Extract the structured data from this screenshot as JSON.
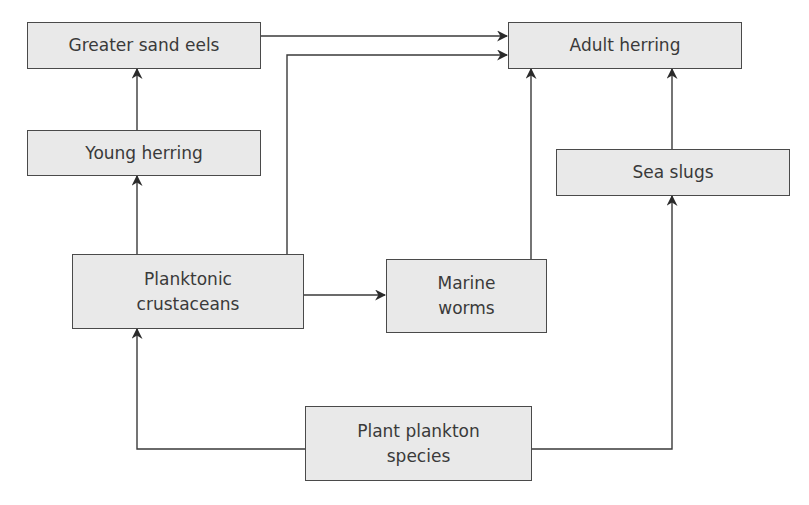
{
  "diagram": {
    "type": "food web",
    "colors": {
      "node_fill": "#e9e9e9",
      "node_border": "#4a4a4a",
      "edge": "#3a3a3a",
      "text": "#3a3a3a"
    },
    "nodes": {
      "greater_sand_eels": {
        "label": "Greater sand eels"
      },
      "adult_herring": {
        "label": "Adult herring"
      },
      "young_herring": {
        "label": "Young herring"
      },
      "sea_slugs": {
        "label": "Sea slugs"
      },
      "planktonic_crustaceans": {
        "line1": "Planktonic",
        "line2": "crustaceans"
      },
      "marine_worms": {
        "line1": "Marine",
        "line2": "worms"
      },
      "plant_plankton_species": {
        "line1": "Plant plankton",
        "line2": "species"
      }
    },
    "edges": [
      {
        "from": "Greater sand eels",
        "to": "Adult herring"
      },
      {
        "from": "Planktonic crustaceans",
        "to": "Adult herring"
      },
      {
        "from": "Young herring",
        "to": "Greater sand eels"
      },
      {
        "from": "Planktonic crustaceans",
        "to": "Young herring"
      },
      {
        "from": "Planktonic crustaceans",
        "to": "Marine worms"
      },
      {
        "from": "Marine worms",
        "to": "Adult herring"
      },
      {
        "from": "Sea slugs",
        "to": "Adult herring"
      },
      {
        "from": "Plant plankton species",
        "to": "Planktonic crustaceans"
      },
      {
        "from": "Plant plankton species",
        "to": "Sea slugs"
      }
    ]
  }
}
